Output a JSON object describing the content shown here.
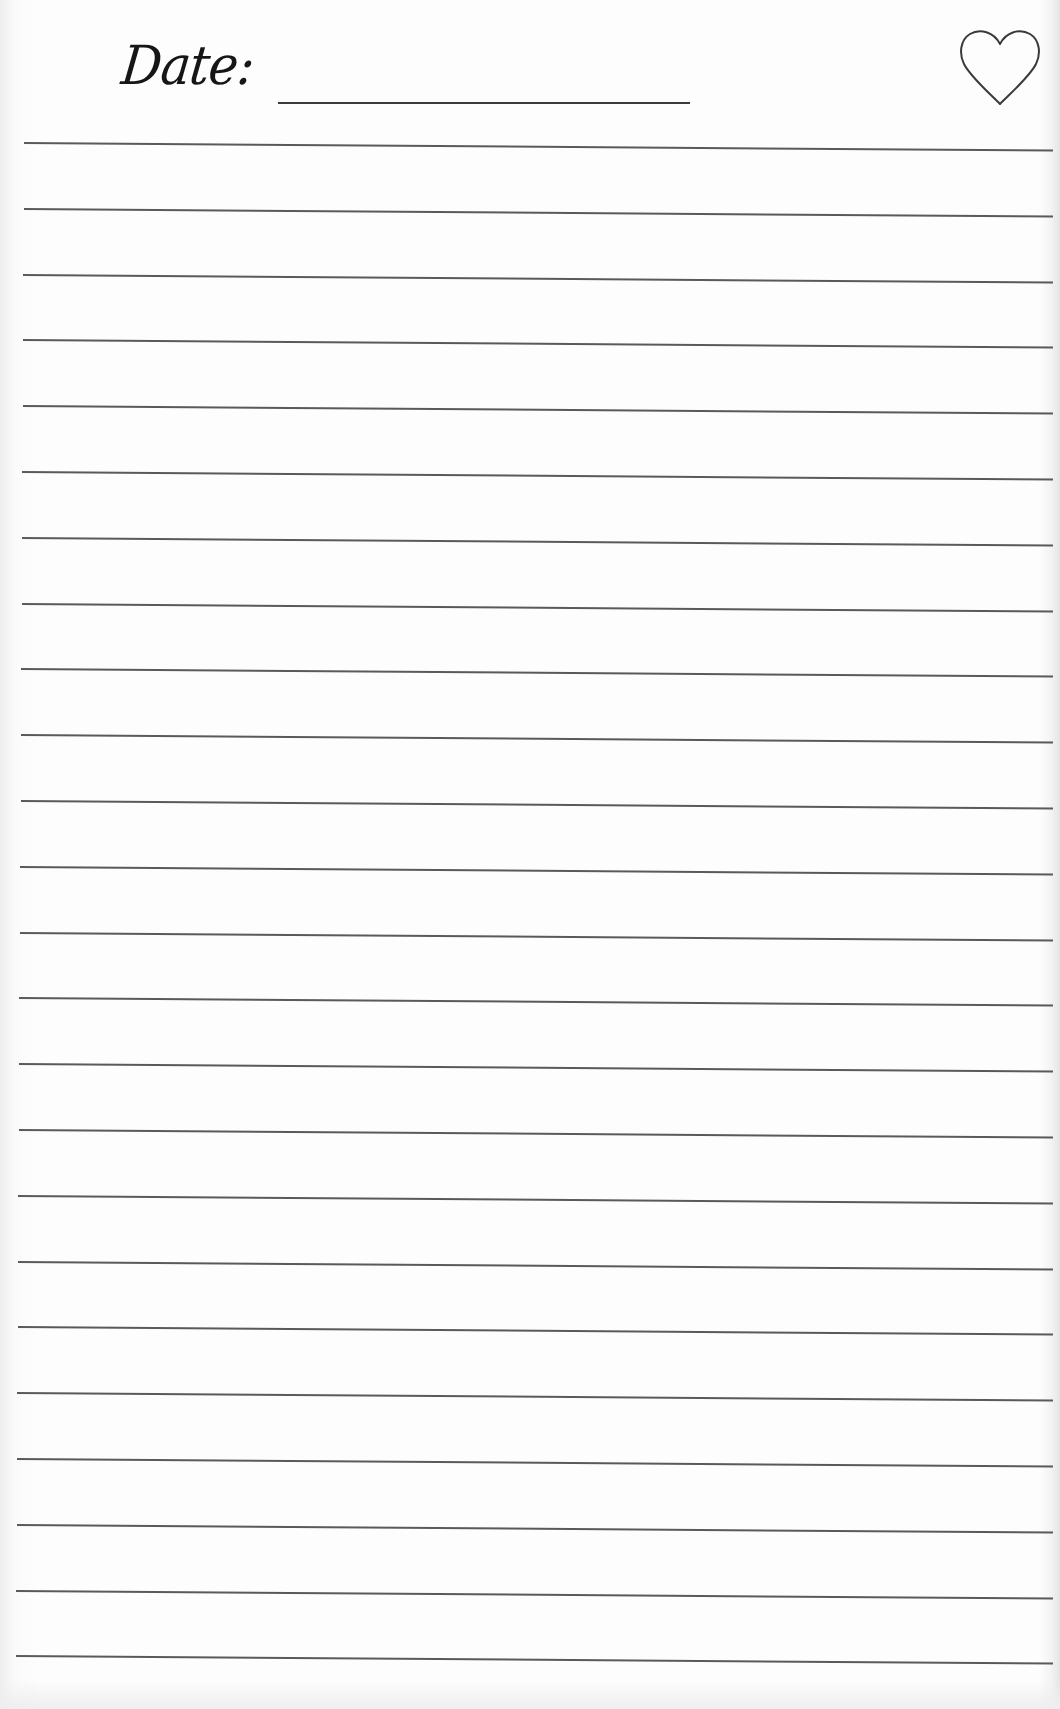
{
  "header": {
    "date_label": "Date:",
    "date_value": "",
    "heart_icon": "heart-outline-icon"
  },
  "colors": {
    "ink": "#161616",
    "rule": "#5a5a5a",
    "paper": "#fdfdfd"
  },
  "ruled_lines": {
    "count": 24,
    "first_y": 142,
    "spacing": 65.8
  }
}
